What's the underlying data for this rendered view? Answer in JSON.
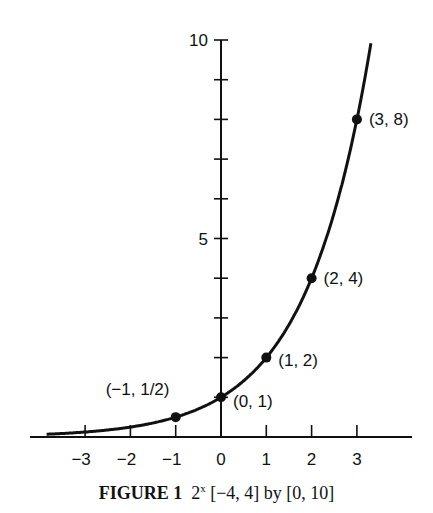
{
  "chart_data": {
    "type": "line",
    "function": "2^x",
    "xlim": [
      -4,
      4
    ],
    "ylim": [
      0,
      10
    ],
    "x_ticks": [
      -3,
      -2,
      -1,
      0,
      1,
      2,
      3
    ],
    "x_tick_labels": [
      "-3",
      "-2",
      "-1",
      "0",
      "1",
      "2",
      "3"
    ],
    "y_ticks": [
      1,
      2,
      3,
      4,
      5,
      6,
      7,
      8,
      9,
      10
    ],
    "y_tick_labels": {
      "5": "5",
      "10": "10"
    },
    "grid": false,
    "points": [
      {
        "x": -1,
        "y": 0.5,
        "label": "(−1, 1/2)"
      },
      {
        "x": 0,
        "y": 1,
        "label": "(0, 1)"
      },
      {
        "x": 1,
        "y": 2,
        "label": "(1, 2)"
      },
      {
        "x": 2,
        "y": 4,
        "label": "(2, 4)"
      },
      {
        "x": 3,
        "y": 8,
        "label": "(3, 8)"
      }
    ],
    "xlabel": "",
    "ylabel": ""
  },
  "caption": {
    "figure": "FIGURE 1",
    "func_base": "2",
    "func_exp": "x",
    "range": "[−4, 4] by [0, 10]"
  }
}
